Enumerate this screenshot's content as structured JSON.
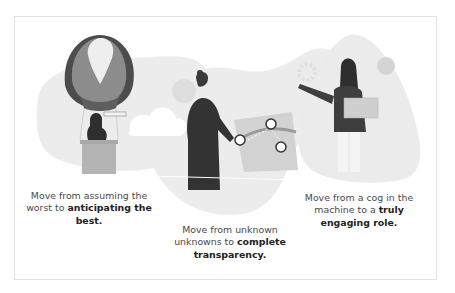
{
  "panels": [
    {
      "illustration": "hot-air-balloon-with-telescope",
      "caption_plain": "Move from assuming the worst to ",
      "caption_bold": "anticipating the best."
    },
    {
      "illustration": "person-with-map-and-pins",
      "caption_plain": "Move from unknown unknowns to ",
      "caption_bold": "complete transparency."
    },
    {
      "illustration": "person-with-laptop-and-gears",
      "caption_plain": "Move from a cog in the machine to a ",
      "caption_bold": "truly engaging role."
    }
  ],
  "colors": {
    "blob": "#ececec",
    "blob_dark": "#e2e2e2",
    "figure_dark": "#3a3a3a",
    "balloon_mid": "#8a8a8a",
    "balloon_light": "#c8c8c8",
    "text": "#4a4a4a",
    "border": "#e2e2e2"
  }
}
